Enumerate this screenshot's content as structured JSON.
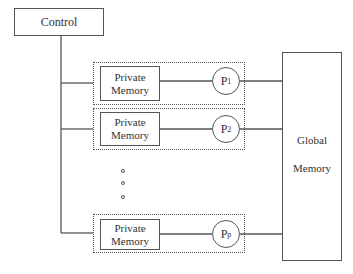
{
  "diagram": {
    "control": {
      "label": "Control"
    },
    "processors": [
      {
        "memory_line1": "Private",
        "memory_line2": "Memory",
        "proc_base": "P",
        "proc_sub": "1"
      },
      {
        "memory_line1": "Private",
        "memory_line2": "Memory",
        "proc_base": "P",
        "proc_sub": "2"
      },
      {
        "memory_line1": "Private",
        "memory_line2": "Memory",
        "proc_base": "P",
        "proc_sub": "p"
      }
    ],
    "ellipsis": "vertical-dots",
    "global_memory": {
      "line1": "Global",
      "line2": "Memory"
    }
  }
}
